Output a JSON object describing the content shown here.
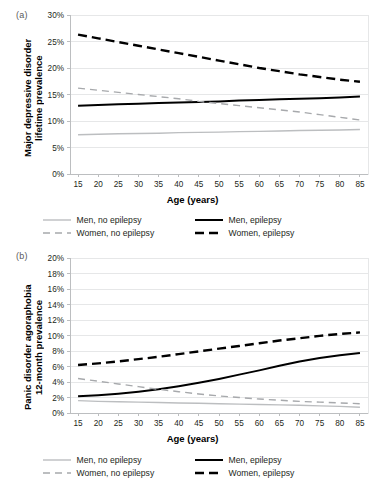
{
  "figure": {
    "panels": [
      {
        "id": "a",
        "panel_label": "(a)",
        "ylabel": "Major depressive disorder\nlifetime prevalence",
        "xlabel": "Age (years)"
      },
      {
        "id": "b",
        "panel_label": "(b)",
        "ylabel": "Panic disorder agoraphobia\n12-month prevalence",
        "xlabel": "Age (years)"
      }
    ],
    "legend": {
      "items": [
        {
          "label": "Men, no epilepsy",
          "color": "#bcbec0",
          "dash": "none",
          "width": 1.3
        },
        {
          "label": "Men, epilepsy",
          "color": "#000000",
          "dash": "none",
          "width": 2.0
        },
        {
          "label": "Women, no epilepsy",
          "color": "#a7a9ac",
          "dash": "dashed",
          "width": 1.3
        },
        {
          "label": "Women, epilepsy",
          "color": "#000000",
          "dash": "dashed",
          "width": 2.4
        }
      ]
    }
  },
  "colors": {
    "men_no_epilepsy": "#bcbec0",
    "men_epilepsy": "#000000",
    "women_no_epilepsy": "#a7a9ac",
    "women_epilepsy": "#000000",
    "gridline": "#e6e7e8",
    "axis": "#bcbec0",
    "text": "#231f20"
  },
  "chart_data": [
    {
      "type": "line",
      "panel": "a",
      "title": "Major depressive disorder lifetime prevalence by age",
      "xlabel": "Age (years)",
      "ylabel": "Major depressive disorder lifetime prevalence",
      "xlim": [
        13,
        87
      ],
      "ylim": [
        0,
        30
      ],
      "xticks": [
        15,
        20,
        25,
        30,
        35,
        40,
        45,
        50,
        55,
        60,
        65,
        70,
        75,
        80,
        85
      ],
      "yticks": [
        0,
        5,
        10,
        15,
        20,
        25,
        30
      ],
      "ytick_labels": [
        "0%",
        "5%",
        "10%",
        "15%",
        "20%",
        "25%",
        "30%"
      ],
      "xtick_labels": [
        "15",
        "20",
        "25",
        "30",
        "35",
        "40",
        "45",
        "50",
        "55",
        "60",
        "65",
        "70",
        "75",
        "80",
        "85"
      ],
      "grid": true,
      "legend_position": "bottom",
      "x": [
        15,
        20,
        25,
        30,
        35,
        40,
        45,
        50,
        55,
        60,
        65,
        70,
        75,
        80,
        85
      ],
      "series": [
        {
          "name": "Men, no epilepsy",
          "style": "solid",
          "color": "#bcbec0",
          "values": [
            7.4,
            7.5,
            7.6,
            7.65,
            7.7,
            7.8,
            7.85,
            7.9,
            8.0,
            8.05,
            8.1,
            8.2,
            8.25,
            8.3,
            8.4
          ]
        },
        {
          "name": "Men, epilepsy",
          "style": "solid",
          "color": "#000000",
          "values": [
            12.9,
            13.0,
            13.15,
            13.25,
            13.4,
            13.5,
            13.6,
            13.7,
            13.85,
            13.95,
            14.1,
            14.2,
            14.3,
            14.45,
            14.6
          ]
        },
        {
          "name": "Women, no epilepsy",
          "style": "dashed",
          "color": "#a7a9ac",
          "values": [
            16.2,
            15.8,
            15.4,
            15.0,
            14.6,
            14.2,
            13.7,
            13.3,
            12.9,
            12.5,
            12.1,
            11.7,
            11.2,
            10.7,
            10.2
          ]
        },
        {
          "name": "Women, epilepsy",
          "style": "dashed",
          "color": "#000000",
          "values": [
            26.3,
            25.6,
            24.9,
            24.2,
            23.5,
            22.8,
            22.1,
            21.4,
            20.7,
            20.0,
            19.4,
            18.8,
            18.3,
            17.8,
            17.4
          ]
        }
      ],
      "annotations": [
        "Women, no epilepsy crosses Men, epilepsy at approximately age 43"
      ]
    },
    {
      "type": "line",
      "panel": "b",
      "title": "Panic disorder agoraphobia 12-month prevalence by age",
      "xlabel": "Age (years)",
      "ylabel": "Panic disorder agoraphobia 12-month prevalence",
      "xlim": [
        13,
        87
      ],
      "ylim": [
        0,
        20
      ],
      "xticks": [
        15,
        20,
        25,
        30,
        35,
        40,
        45,
        50,
        55,
        60,
        65,
        70,
        75,
        80,
        85
      ],
      "yticks": [
        0,
        2,
        4,
        6,
        8,
        10,
        12,
        14,
        16,
        18,
        20
      ],
      "ytick_labels": [
        "0%",
        "2%",
        "4%",
        "6%",
        "8%",
        "10%",
        "12%",
        "14%",
        "16%",
        "18%",
        "20%"
      ],
      "xtick_labels": [
        "15",
        "20",
        "25",
        "30",
        "35",
        "40",
        "45",
        "50",
        "55",
        "60",
        "65",
        "70",
        "75",
        "80",
        "85"
      ],
      "grid": true,
      "legend_position": "bottom",
      "x": [
        15,
        20,
        25,
        30,
        35,
        40,
        45,
        50,
        55,
        60,
        65,
        70,
        75,
        80,
        85
      ],
      "series": [
        {
          "name": "Men, no epilepsy",
          "style": "solid",
          "color": "#bcbec0",
          "values": [
            1.6,
            1.5,
            1.45,
            1.4,
            1.35,
            1.3,
            1.25,
            1.2,
            1.15,
            1.1,
            1.05,
            1.0,
            0.92,
            0.85,
            0.75
          ]
        },
        {
          "name": "Men, epilepsy",
          "style": "solid",
          "color": "#000000",
          "values": [
            2.15,
            2.3,
            2.5,
            2.75,
            3.05,
            3.45,
            3.9,
            4.4,
            4.95,
            5.5,
            6.1,
            6.65,
            7.1,
            7.45,
            7.75
          ]
        },
        {
          "name": "Women, no epilepsy",
          "style": "dashed",
          "color": "#a7a9ac",
          "values": [
            4.45,
            4.1,
            3.75,
            3.4,
            3.05,
            2.75,
            2.45,
            2.2,
            2.0,
            1.8,
            1.65,
            1.5,
            1.4,
            1.3,
            1.2
          ]
        },
        {
          "name": "Women, epilepsy",
          "style": "dashed",
          "color": "#000000",
          "values": [
            6.2,
            6.4,
            6.65,
            6.95,
            7.25,
            7.6,
            7.95,
            8.3,
            8.65,
            9.0,
            9.35,
            9.65,
            9.95,
            10.2,
            10.4
          ]
        }
      ],
      "annotations": [
        "Men, epilepsy crosses Women, no epilepsy at approximately age 35"
      ]
    }
  ]
}
